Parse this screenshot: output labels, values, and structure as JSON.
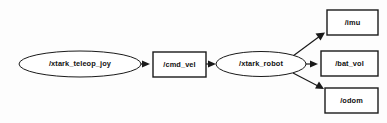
{
  "diagram": {
    "type": "ros-computation-graph",
    "title": "",
    "background_color": "#fdfdfd",
    "stroke_color": "#1a1a1a",
    "fill_color": "#ffffff",
    "nodes": [
      {
        "id": "xtark_teleop_joy",
        "label": "/xtark_teleop_joy",
        "shape": "ellipse",
        "cx": 80,
        "cy": 64,
        "rx": 61,
        "ry": 13
      },
      {
        "id": "xtark_robot",
        "label": "/xtark_robot",
        "shape": "ellipse",
        "cx": 261,
        "cy": 64,
        "rx": 45,
        "ry": 12.5
      }
    ],
    "topics": [
      {
        "id": "cmd_vel",
        "label": "/cmd_vel",
        "shape": "rect",
        "x": 153,
        "y": 52,
        "w": 53,
        "h": 25
      },
      {
        "id": "imu",
        "label": "/imu",
        "shape": "rect",
        "x": 327,
        "y": 10,
        "w": 51,
        "h": 25
      },
      {
        "id": "bat_vol",
        "label": "/bat_vol",
        "shape": "rect",
        "x": 321,
        "y": 51,
        "w": 57,
        "h": 25
      },
      {
        "id": "odom",
        "label": "/odom",
        "shape": "rect",
        "x": 325,
        "y": 88,
        "w": 53,
        "h": 25
      }
    ],
    "edges": [
      {
        "id": "edge-teleop-to-cmdvel",
        "from": "xtark_teleop_joy",
        "to": "cmd_vel",
        "path": "M141,64 L148,64",
        "head": "150,64 142,60.5 142,67.5"
      },
      {
        "id": "edge-cmdvel-to-robot",
        "from": "cmd_vel",
        "to": "xtark_robot",
        "path": "M206,64 L212,64",
        "head": "216,64 208,60.5 208,67.5"
      },
      {
        "id": "edge-robot-to-imu",
        "from": "xtark_robot",
        "to": "imu",
        "path": "M293,56 L320,36",
        "head": "325,32.5 315.5,33.5 320.5,40.5"
      },
      {
        "id": "edge-robot-to-batvol",
        "from": "xtark_robot",
        "to": "bat_vol",
        "path": "M306,64 L313,64",
        "head": "318,64 310,60.5 310,67.5"
      },
      {
        "id": "edge-robot-to-odom",
        "from": "xtark_robot",
        "to": "odom",
        "path": "M293,73 L318,86",
        "head": "324,89 319,81.5 315,88.5"
      }
    ]
  }
}
